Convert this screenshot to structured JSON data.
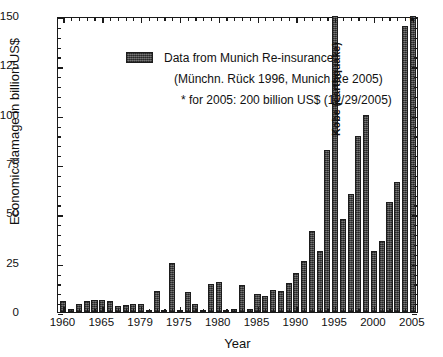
{
  "chart_data": {
    "type": "bar",
    "title": "",
    "xlabel": "Year",
    "ylabel": "Economic damage in billion US$",
    "ylim": [
      0,
      150
    ],
    "yticks": [
      0,
      25,
      50,
      75,
      100,
      125,
      150
    ],
    "xticks": [
      "1960",
      "1965",
      "1979",
      "1975",
      "1980",
      "1985",
      "1990",
      "1995",
      "2000",
      "2005"
    ],
    "xtick_years": [
      1960,
      1965,
      1970,
      1975,
      1980,
      1985,
      1990,
      1995,
      2000,
      2005
    ],
    "grid": false,
    "legend_position": "upper-left",
    "bar_color": "#4a4a4a",
    "x": [
      1960,
      1961,
      1962,
      1963,
      1964,
      1965,
      1966,
      1967,
      1968,
      1969,
      1970,
      1971,
      1972,
      1973,
      1974,
      1975,
      1976,
      1977,
      1978,
      1979,
      1980,
      1981,
      1982,
      1983,
      1984,
      1985,
      1986,
      1987,
      1988,
      1989,
      1990,
      1991,
      1992,
      1993,
      1994,
      1995,
      1996,
      1997,
      1998,
      1999,
      2000,
      2001,
      2002,
      2003,
      2004,
      2005
    ],
    "values": [
      5.5,
      1.5,
      4.0,
      5.5,
      6.0,
      6.0,
      5.5,
      3.0,
      3.5,
      4.0,
      4.0,
      1.0,
      10.5,
      0.5,
      25.0,
      1.0,
      10.0,
      4.0,
      1.0,
      14.0,
      15.0,
      1.0,
      1.5,
      13.5,
      1.5,
      9.0,
      8.0,
      11.0,
      10.5,
      14.5,
      20.0,
      26.0,
      41.0,
      31.0,
      82.0,
      150.0,
      47.0,
      60.0,
      89.0,
      100.0,
      31.0,
      36.0,
      56.0,
      66.0,
      145.0,
      150.0
    ],
    "annotations": [
      {
        "label": "Kobe (earthquake)",
        "year": 1995,
        "note": "bar clipped at top of axis"
      },
      {
        "label": "*",
        "year": 2005,
        "note": "for 2005: 200 billion US$ (12/29/2005)"
      }
    ],
    "legend": [
      "Data from Munich Re-insurance",
      "(Münchn. Rück 1996, Munich Re 2005)",
      "* for 2005: 200 billion US$ (12/29/2005)"
    ]
  },
  "legend": {
    "line1": "Data from Munich Re-insurance",
    "line2": "(Münchn. Rück 1996, Munich Re 2005)",
    "line3": "* for 2005: 200 billion US$ (12/29/2005)"
  },
  "axes": {
    "y_title": "Economic damage in billion US$",
    "x_title": "Year"
  },
  "annotation": {
    "kobe": "Kobe (earthquake)"
  }
}
